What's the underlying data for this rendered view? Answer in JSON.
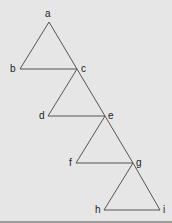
{
  "diagram": {
    "type": "tree-of-triangles",
    "nodes": [
      {
        "id": "a",
        "label": "a",
        "x": 49,
        "y": 22,
        "lx": 45,
        "ly": 17
      },
      {
        "id": "b",
        "label": "b",
        "x": 20,
        "y": 69,
        "lx": 10,
        "ly": 72
      },
      {
        "id": "c",
        "label": "c",
        "x": 77,
        "y": 69,
        "lx": 81,
        "ly": 72
      },
      {
        "id": "d",
        "label": "d",
        "x": 48,
        "y": 116,
        "lx": 39,
        "ly": 119
      },
      {
        "id": "e",
        "label": "e",
        "x": 105,
        "y": 116,
        "lx": 108,
        "ly": 119
      },
      {
        "id": "f",
        "label": "f",
        "x": 76,
        "y": 163,
        "lx": 69,
        "ly": 166
      },
      {
        "id": "g",
        "label": "g",
        "x": 133,
        "y": 163,
        "lx": 136,
        "ly": 166
      },
      {
        "id": "h",
        "label": "h",
        "x": 104,
        "y": 210,
        "lx": 95,
        "ly": 213
      },
      {
        "id": "i",
        "label": "i",
        "x": 160,
        "y": 210,
        "lx": 163,
        "ly": 213
      }
    ],
    "edges": [
      [
        "a",
        "b"
      ],
      [
        "a",
        "c"
      ],
      [
        "b",
        "c"
      ],
      [
        "c",
        "d"
      ],
      [
        "c",
        "e"
      ],
      [
        "d",
        "e"
      ],
      [
        "e",
        "f"
      ],
      [
        "e",
        "g"
      ],
      [
        "f",
        "g"
      ],
      [
        "g",
        "h"
      ],
      [
        "g",
        "i"
      ],
      [
        "h",
        "i"
      ]
    ],
    "colors": {
      "background": "#e6e6e6",
      "edge": "#555555",
      "label": "#222222"
    }
  }
}
